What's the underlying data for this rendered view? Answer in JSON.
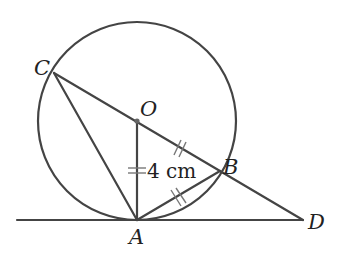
{
  "diagram": {
    "type": "geometry",
    "colors": {
      "stroke": "#444444",
      "text": "#222222",
      "background": "#ffffff"
    },
    "circle": {
      "center": "O",
      "cx": 137,
      "cy": 121,
      "r": 99
    },
    "points": [
      {
        "id": "C",
        "label": "C",
        "x": 54,
        "y": 73
      },
      {
        "id": "O",
        "label": "O",
        "x": 137,
        "y": 121
      },
      {
        "id": "B",
        "label": "B",
        "x": 220,
        "y": 171
      },
      {
        "id": "A",
        "label": "A",
        "x": 137,
        "y": 220
      },
      {
        "id": "D",
        "label": "D",
        "x": 303,
        "y": 220
      }
    ],
    "segments": [
      {
        "from": "C",
        "to": "D",
        "note": "passes through O and B"
      },
      {
        "from": "C",
        "to": "A"
      },
      {
        "from": "O",
        "to": "A"
      },
      {
        "from": "A",
        "to": "B"
      },
      {
        "from": "tangent-left-end",
        "to": "D",
        "note": "tangent at A"
      }
    ],
    "equal_marks": [
      "OA",
      "OB",
      "AB"
    ],
    "measurement": {
      "segment": "OA",
      "label": "4 cm"
    }
  }
}
